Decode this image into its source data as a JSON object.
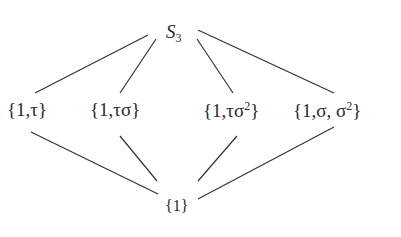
{
  "diagram": {
    "type": "subgroup-lattice",
    "top": {
      "id": "S3",
      "label": "S",
      "subscript": "3"
    },
    "middle": [
      {
        "id": "t",
        "label": "{1,τ}"
      },
      {
        "id": "ts",
        "label": "{1,τσ}"
      },
      {
        "id": "ts2",
        "label_base": "{1,τσ",
        "sup": "2",
        "close": "}"
      },
      {
        "id": "s",
        "label_base": "{1,σ, σ",
        "sup": "2",
        "close": "}"
      }
    ],
    "bottom": {
      "id": "e",
      "label": "{1}"
    },
    "edges": [
      [
        "S3",
        "t"
      ],
      [
        "S3",
        "ts"
      ],
      [
        "S3",
        "ts2"
      ],
      [
        "S3",
        "s"
      ],
      [
        "t",
        "e"
      ],
      [
        "ts",
        "e"
      ],
      [
        "ts2",
        "e"
      ],
      [
        "s",
        "e"
      ]
    ],
    "line_color": "#333333"
  }
}
